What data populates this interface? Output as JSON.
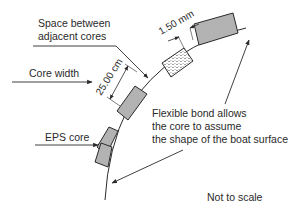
{
  "diagram": {
    "type": "annotated cross-section",
    "labels": {
      "space_between": [
        "Space between",
        "adjacent cores"
      ],
      "core_width": "Core width",
      "dimension_width": "25.00 cm",
      "dimension_gap": "1.50 mm",
      "eps_core": "EPS core",
      "flexible_bond": [
        "Flexible bond allows",
        "the core to assume",
        "the shape of the boat surface"
      ],
      "not_to_scale": "Not to scale"
    },
    "colors": {
      "stroke": "#2a2a2a",
      "hatch_dense": "#555555",
      "hatch_light": "#8a8a8a",
      "background": "#ffffff"
    }
  }
}
